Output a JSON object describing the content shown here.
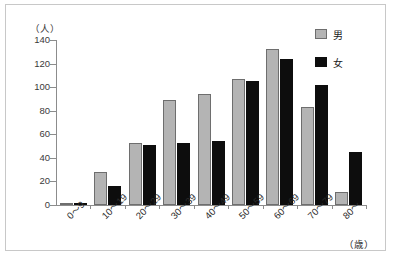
{
  "chart_data": {
    "type": "bar",
    "title": "",
    "xlabel": "（歳）",
    "ylabel": "（人）",
    "ylim": [
      0,
      140
    ],
    "ytick_step": 20,
    "yticks": [
      "140",
      "120",
      "100",
      "80",
      "60",
      "40",
      "20",
      "0"
    ],
    "ytick_values": [
      140,
      120,
      100,
      80,
      60,
      40,
      20,
      0
    ],
    "grid": false,
    "legend_position": "top-right",
    "categories": [
      "0〜9",
      "10〜19",
      "20〜29",
      "30〜39",
      "40〜49",
      "50〜59",
      "60〜69",
      "70〜79",
      "80〜"
    ],
    "series": [
      {
        "name": "男",
        "color": "#b4b4b4",
        "values": [
          2,
          28,
          53,
          89,
          94,
          107,
          132,
          83,
          11
        ]
      },
      {
        "name": "女",
        "color": "#0d0d0d",
        "values": [
          2,
          16,
          51,
          53,
          54,
          105,
          124,
          102,
          45
        ]
      }
    ]
  },
  "legend": {
    "male_label": "男",
    "female_label": "女"
  },
  "axis": {
    "y_unit": "（人）",
    "x_unit": "（歳）"
  }
}
